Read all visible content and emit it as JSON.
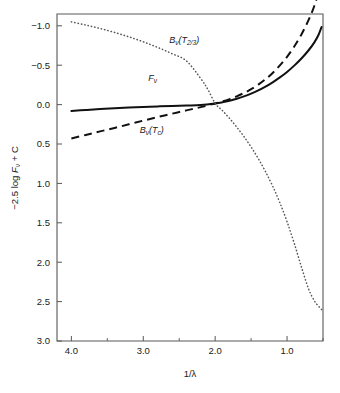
{
  "chart_data": {
    "type": "line",
    "title": "",
    "subtitle": "",
    "xlabel": "1/λ",
    "ylabel": "−2.5 log Fᵥ + C",
    "ylabel_parts": {
      "prefix": "−2.5 log ",
      "symbol": "F",
      "symbol_sub": "ν",
      "suffix": " + C"
    },
    "xlim": [
      4.2,
      0.5
    ],
    "ylim": [
      3.0,
      -1.15
    ],
    "x_axis_reversed": true,
    "y_axis_reversed": true,
    "grid": false,
    "legend_position": "inline-annotations",
    "x_ticks": [
      4.0,
      3.0,
      2.0,
      1.0
    ],
    "x_ticklabels": [
      "4.0",
      "3.0",
      "2.0",
      "1.0"
    ],
    "x_minor_ticks": [
      3.5,
      2.5,
      1.5,
      0.5
    ],
    "y_ticks": [
      -1.0,
      -0.5,
      0.0,
      0.5,
      1.0,
      1.5,
      2.0,
      2.5,
      3.0
    ],
    "y_ticklabels": [
      "−1.0",
      "−0.5",
      "0.0",
      "0.5",
      "1.0",
      "1.5",
      "2.0",
      "2.5",
      "3.0"
    ],
    "y_minor_ticks": [],
    "series": [
      {
        "name": "Fᵥ",
        "label_parts": {
          "symbol": "F",
          "symbol_sub": "ν",
          "paren": ""
        },
        "style": "solid",
        "color": "#111111",
        "label_x": 2.93,
        "label_y": -0.3,
        "x": [
          4.0,
          3.8,
          3.6,
          3.4,
          3.2,
          3.0,
          2.8,
          2.6,
          2.4,
          2.2,
          2.0,
          1.9,
          1.8,
          1.7,
          1.6,
          1.5,
          1.4,
          1.3,
          1.2,
          1.1,
          1.0,
          0.9,
          0.8,
          0.7,
          0.62,
          0.56,
          0.52
        ],
        "y": [
          0.08,
          0.068,
          0.057,
          0.047,
          0.038,
          0.03,
          0.023,
          0.018,
          0.012,
          0.005,
          -0.015,
          -0.03,
          -0.05,
          -0.075,
          -0.105,
          -0.14,
          -0.18,
          -0.228,
          -0.283,
          -0.345,
          -0.415,
          -0.495,
          -0.585,
          -0.69,
          -0.79,
          -0.89,
          -0.985
        ]
      },
      {
        "name": "Bᵥ(T_c)",
        "label_parts": {
          "symbol": "B",
          "symbol_sub": "ν",
          "paren_open": "(",
          "arg": "T",
          "arg_sub": "c",
          "paren_close": ")"
        },
        "style": "dashed",
        "color": "#111111",
        "label_x": 3.05,
        "label_y": 0.36,
        "x": [
          4.0,
          3.8,
          3.6,
          3.4,
          3.2,
          3.0,
          2.8,
          2.6,
          2.4,
          2.2,
          2.0,
          1.9,
          1.8,
          1.7,
          1.6,
          1.5,
          1.4,
          1.3,
          1.2,
          1.1,
          1.0,
          0.9,
          0.8,
          0.7,
          0.62,
          0.56,
          0.52
        ],
        "y": [
          0.43,
          0.385,
          0.34,
          0.296,
          0.25,
          0.203,
          0.158,
          0.115,
          0.073,
          0.032,
          -0.015,
          -0.04,
          -0.07,
          -0.105,
          -0.147,
          -0.196,
          -0.254,
          -0.322,
          -0.402,
          -0.497,
          -0.607,
          -0.737,
          -0.89,
          -1.075,
          -1.255,
          -1.45,
          -1.7
        ]
      },
      {
        "name": "Bᵥ(T_2/3)",
        "label_parts": {
          "symbol": "B",
          "symbol_sub": "ν",
          "paren_open": "(",
          "arg": "T",
          "arg_sub": "2/3",
          "paren_close": ")"
        },
        "style": "dotted",
        "color": "#555555",
        "label_x": 2.64,
        "label_y": -0.78,
        "x": [
          4.0,
          3.8,
          3.6,
          3.4,
          3.2,
          3.0,
          2.8,
          2.6,
          2.4,
          2.2,
          2.0,
          1.9,
          1.8,
          1.7,
          1.6,
          1.5,
          1.4,
          1.3,
          1.2,
          1.1,
          1.0,
          0.9,
          0.8,
          0.7,
          0.62,
          0.56,
          0.52
        ],
        "y": [
          -1.05,
          -1.01,
          -0.966,
          -0.916,
          -0.86,
          -0.797,
          -0.726,
          -0.646,
          -0.555,
          -0.451,
          -0.015,
          0.075,
          0.175,
          0.285,
          0.405,
          0.538,
          0.685,
          0.85,
          1.035,
          1.245,
          1.485,
          1.76,
          2.06,
          2.34,
          2.49,
          2.56,
          2.6
        ]
      }
    ],
    "series_dotted_override": {
      "note": "dotted curve is smooth through the crossing; mid anchors",
      "x": [
        2.4,
        2.2,
        2.1,
        2.0
      ],
      "y": [
        -0.555,
        -0.33,
        -0.19,
        -0.015
      ]
    }
  }
}
